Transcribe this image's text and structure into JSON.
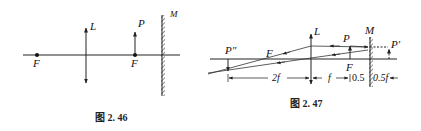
{
  "figure_left": {
    "caption": "图 2. 46",
    "labels": {
      "lens": "L",
      "object": "P",
      "mirror": "M",
      "focus_left": "F",
      "focus_right": "F"
    }
  },
  "figure_right": {
    "caption": "图 2. 47",
    "labels": {
      "lens": "L",
      "object": "P",
      "mirror": "M",
      "virtual_image": "P'",
      "final_image": "P\"",
      "focus_left": "F",
      "focus_right": "F"
    },
    "dimensions": {
      "left_span": "2f",
      "middle_span": "f",
      "mirror_left": "0.5",
      "mirror_right": "0.5f"
    }
  }
}
